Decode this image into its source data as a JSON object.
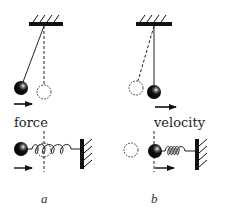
{
  "figure": {
    "type": "physics-diagram",
    "panels": [
      {
        "id": "a",
        "caption": "a",
        "label": "force",
        "description": "Pendulum displaced left at maximum amplitude; force arrow points right toward equilibrium. Mass-spring: ball displaced left of equilibrium (dashed line/circle), spring stretched, force arrow right."
      },
      {
        "id": "b",
        "caption": "b",
        "label": "velocity",
        "description": "Pendulum passing through equilibrium (vertical) with velocity arrow right; dashed circle shows former displaced position. Mass-spring: ball at equilibrium, velocity arrow right, spring compressed toward wall."
      }
    ],
    "colors": {
      "ink": "#111111",
      "background": "#ffffff"
    }
  }
}
